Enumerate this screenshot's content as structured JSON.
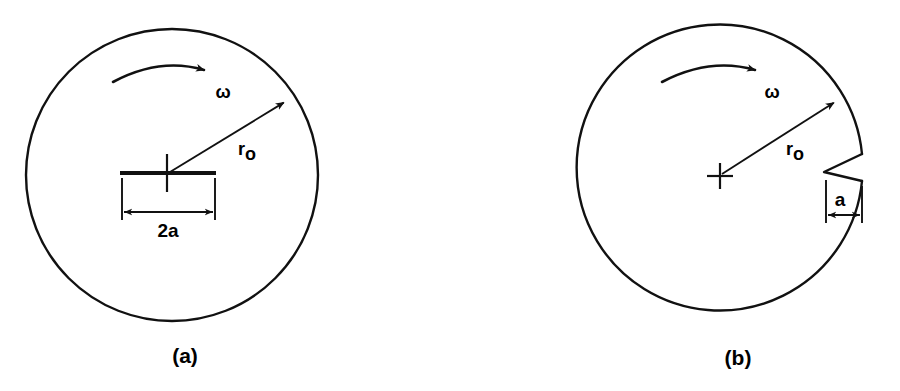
{
  "figure": {
    "background_color": "#ffffff",
    "ink_color": "#111111",
    "width": 900,
    "height": 391
  },
  "panels": [
    {
      "id": "a",
      "caption": "(a)",
      "caption_x": 185,
      "caption_y": 363,
      "disk": {
        "name": "rotating-disk",
        "cx": 172,
        "cy": 175,
        "r": 146
      },
      "center_mark": {
        "name": "center-cross",
        "cx": 167,
        "cy": 173,
        "arm": 19
      },
      "crack": {
        "name": "central-crack",
        "x1": 120,
        "x2": 216,
        "y": 173
      },
      "radius_arrow": {
        "name": "radius-arrow",
        "x1": 170,
        "y1": 172,
        "x2": 288,
        "y2": 100,
        "label": "r",
        "subscript": "o",
        "label_x": 243,
        "label_y": 155
      },
      "rotation_arrow": {
        "name": "rotation-arc-arrow",
        "label": "ω",
        "label_x": 223,
        "label_y": 98,
        "path": "M 113 82 Q 160 57 204 70",
        "tip_x": 209,
        "tip_y": 72
      },
      "dimension": {
        "name": "crack-length-dimension",
        "label": "2a",
        "label_x": 168,
        "label_y": 237,
        "line_y": 212,
        "x1": 122,
        "x2": 215,
        "ext_top_y": 176,
        "ext_bottom_y": 220
      }
    },
    {
      "id": "b",
      "caption": "(b)",
      "caption_x": 738,
      "caption_y": 365,
      "disk": {
        "name": "rotating-disk",
        "cx": 720,
        "cy": 176,
        "r": 143
      },
      "center_mark": {
        "name": "center-cross",
        "cx": 720,
        "cy": 176,
        "arm": 13
      },
      "notch": {
        "name": "edge-notch",
        "outer_top_x": 862,
        "outer_top_y": 154,
        "vertex_x": 824,
        "vertex_y": 172,
        "outer_bottom_x": 862,
        "outer_bottom_y": 181
      },
      "radius_arrow": {
        "name": "radius-arrow",
        "x1": 722,
        "y1": 174,
        "x2": 838,
        "y2": 100,
        "label": "r",
        "subscript": "o",
        "label_x": 791,
        "label_y": 155
      },
      "rotation_arrow": {
        "name": "rotation-arc-arrow",
        "label": "ω",
        "label_x": 772,
        "label_y": 98,
        "path": "M 662 82 Q 710 57 755 70",
        "tip_x": 760,
        "tip_y": 72
      },
      "dimension": {
        "name": "notch-depth-dimension",
        "label": "a",
        "label_x": 840,
        "label_y": 206,
        "line_y": 215,
        "x1": 826,
        "x2": 862,
        "ext_left_top_y": 180,
        "ext_right_top_y": 186,
        "ext_bottom_y": 223
      }
    }
  ]
}
